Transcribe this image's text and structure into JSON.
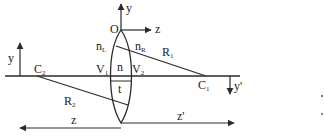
{
  "diagram": {
    "type": "thick-lens-geometry",
    "colors": {
      "line": "#2a2a2a",
      "text": "#222222",
      "background": "#ffffff"
    },
    "axes": {
      "origin_label": "O",
      "upper_y_label": "y",
      "upper_z_label": "z",
      "left_y_label": "y",
      "right_y_label": "y",
      "right_y_prime": "'",
      "bottom_z_label": "z",
      "bottom_zp_label": "z",
      "bottom_zp_prime": "'"
    },
    "lens": {
      "index_label": "n",
      "thickness_label": "t",
      "left_medium": {
        "base": "n",
        "sub": "L"
      },
      "right_medium": {
        "base": "n",
        "sub": "R"
      }
    },
    "vertices": [
      {
        "base": "V",
        "sub": "1"
      },
      {
        "base": "V",
        "sub": "2"
      }
    ],
    "centers": [
      {
        "base": "C",
        "sub": "1"
      },
      {
        "base": "C",
        "sub": "2"
      }
    ],
    "radii": [
      {
        "base": "R",
        "sub": "1"
      },
      {
        "base": "R",
        "sub": "2"
      }
    ]
  }
}
